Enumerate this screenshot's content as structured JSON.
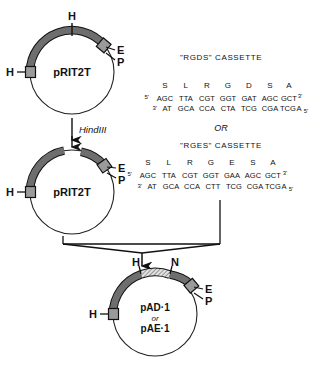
{
  "plasmid_top": {
    "name": "pRIT2T",
    "sites": {
      "h_top": "H",
      "h_left": "H",
      "e": "E",
      "p": "P"
    }
  },
  "plasmid_mid": {
    "name": "pRIT2T",
    "sites": {
      "h_left": "H",
      "e": "E",
      "p": "P"
    }
  },
  "plasmid_bottom": {
    "name_line1": "pAD·1",
    "name_or": "or",
    "name_line2": "pAE·1",
    "sites": {
      "h_top": "H",
      "n": "N",
      "h_left": "H",
      "e": "E",
      "p": "P"
    }
  },
  "digest": {
    "enzyme": "HindIII"
  },
  "connector": {
    "or_label": "OR"
  },
  "cassette_rgds": {
    "title": "\"RGDS\" CASSETTE",
    "amino_acids": [
      "S",
      "L",
      "R",
      "G",
      "D",
      "S",
      "A"
    ],
    "top_prime_start": "5'",
    "top_strand": [
      "AGC",
      "TTA",
      "CGT",
      "GGT",
      "GAT",
      "AGC",
      "GCT"
    ],
    "top_prime_end": "3'",
    "bottom_prime_start": "3'",
    "bottom_strand": [
      "AT",
      "GCA",
      "CCA",
      "CTA",
      "TCG",
      "CGA",
      "TCG",
      "A"
    ],
    "bottom_prime_end": "5'"
  },
  "cassette_rges": {
    "title": "\"RGES\" CASSETTE",
    "amino_acids": [
      "S",
      "L",
      "R",
      "G",
      "E",
      "S",
      "A"
    ],
    "top_prime_start": "5'",
    "top_strand": [
      "AGC",
      "TTA",
      "CGT",
      "GGT",
      "GAA",
      "AGC",
      "GCT"
    ],
    "top_prime_end": "3'",
    "bottom_prime_start": "3'",
    "bottom_strand": [
      "AT",
      "GCA",
      "CCA",
      "CTT",
      "TCG",
      "CGA",
      "TCG",
      "A"
    ],
    "bottom_prime_end": "5'"
  },
  "colors": {
    "arc": "#6e6e6e",
    "arc_stroke": "#111111",
    "site_box": "#9a9a9a",
    "circle_stroke": "#222222",
    "hatch": "#d8d8d8",
    "text": "#111111"
  }
}
